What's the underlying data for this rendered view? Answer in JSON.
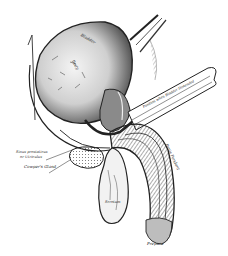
{
  "figure": {
    "kind": "anatomical-illustration",
    "style": "engraving, black and white",
    "colors": {
      "background": "#ffffff",
      "ink": "#1a1a1a",
      "shade": "#6e6e6e",
      "light_shade": "#bdbdbd"
    },
    "labels": {
      "bladder": "Bladder",
      "body": "Body",
      "fossa": "Position when Bladder Distended",
      "sinus": "Sinus prostaticus",
      "sinus2": "or Utriculus",
      "cowper": "Cowper's Gland",
      "penis": "Penis Pendant",
      "scrotum": "Scrotum",
      "prepuce": "Prepuce"
    }
  }
}
